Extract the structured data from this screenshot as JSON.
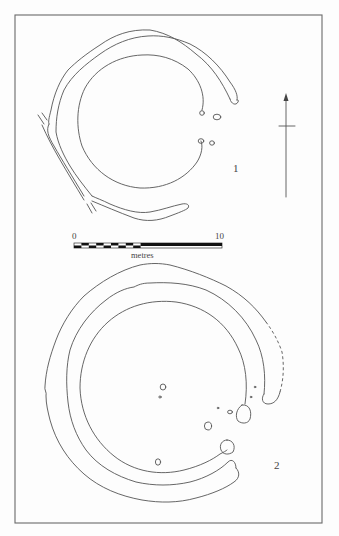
{
  "figure": {
    "plans": [
      {
        "id": "plan-1",
        "label": "1"
      },
      {
        "id": "plan-2",
        "label": "2"
      }
    ],
    "scale_bar": {
      "start_label": "0",
      "end_label": "10",
      "unit_label": "metres"
    },
    "north_arrow": {
      "icon": "north-arrow-icon"
    },
    "colors": {
      "line": "#555555",
      "frame": "#6a6a6a",
      "background": "#fdfdfd"
    }
  }
}
